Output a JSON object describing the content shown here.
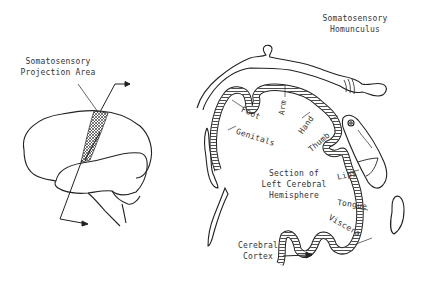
{
  "diagram": {
    "titles": {
      "homunculus_line1": "Somatosensory",
      "homunculus_line2": "Homunculus",
      "projection_line1": "Somatosensory",
      "projection_line2": "Projection Area",
      "section_line1": "Section of",
      "section_line2": "Left Cerebral",
      "section_line3": "Hemisphere",
      "cortex_line1": "Cerebral",
      "cortex_line2": "Cortex"
    },
    "body_regions": [
      {
        "label": "Foot"
      },
      {
        "label": "Arm"
      },
      {
        "label": "Genitals"
      },
      {
        "label": "Hand"
      },
      {
        "label": "Thumb"
      },
      {
        "label": "Lips"
      },
      {
        "label": "Tongue"
      },
      {
        "label": "Viscera"
      }
    ],
    "colors": {
      "line": "#222222",
      "text": "#333333",
      "background": "#ffffff"
    }
  }
}
